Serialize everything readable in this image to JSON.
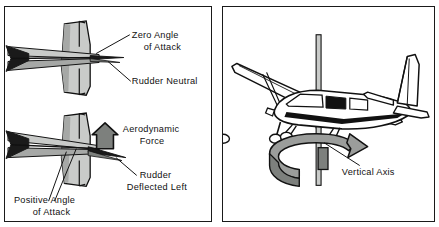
{
  "figure": {
    "panel_count": 2,
    "colors": {
      "outline": "#111111",
      "fill_light": "#c9cbc9",
      "fill_mid": "#a6a8a6",
      "fill_dark": "#7d807d",
      "fill_black": "#1a1a1a",
      "background": "#ffffff"
    }
  },
  "left_panel": {
    "name": "rudder-deflection-top-view",
    "top_diagram": {
      "name": "rudder-neutral-view",
      "labels": {
        "zero_angle_line1": "Zero Angle",
        "zero_angle_line2": "of Attack",
        "rudder_neutral": "Rudder Neutral"
      }
    },
    "bottom_diagram": {
      "name": "rudder-deflected-view",
      "labels": {
        "aerodynamic_force_line1": "Aerodynamic",
        "aerodynamic_force_line2": "Force",
        "rudder_deflected_line1": "Rudder",
        "rudder_deflected_line2": "Deflected Left",
        "positive_angle_line1": "Positive Angle",
        "positive_angle_line2": "of Attack"
      }
    }
  },
  "right_panel": {
    "name": "vertical-axis-view",
    "labels": {
      "vertical_axis": "Vertical Axis"
    },
    "aircraft": "high-wing-single-engine-airplane",
    "rotation_arrow": "yaw-rotation-arrow"
  }
}
